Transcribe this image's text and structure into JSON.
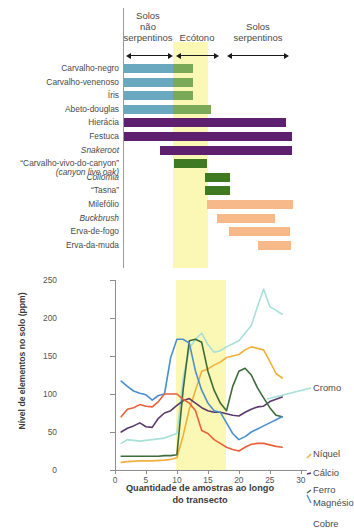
{
  "top_panel": {
    "zones": [
      {
        "key": "nonserpentine",
        "label": "Solos\nnão\nserpentinos",
        "x_start": 127,
        "x_end": 173
      },
      {
        "key": "ecotone",
        "label": "Ecótono",
        "x_start": 176,
        "x_end": 219
      },
      {
        "key": "serpentine",
        "label": "Solos\nserpentinos",
        "x_start": 227,
        "x_end": 289
      }
    ],
    "zone_labels": {
      "nonserpentine": "Solos\nnão\nserpentinos",
      "ecotone": "Ecótono",
      "serpentine": "Solos\nserpentinos"
    },
    "ecotone_band_color": "#fbf7b4",
    "colors": {
      "blue": "#6aa8bf",
      "green": "#7aa957",
      "dark_green": "#3f7a22",
      "purple": "#5d1f6e",
      "orange": "#f7b98a"
    },
    "species": [
      {
        "name": "Carvalho-negro",
        "italic": false,
        "segments": [
          {
            "color": "blue",
            "start": 124,
            "end": 173
          },
          {
            "color": "green",
            "start": 173,
            "end": 193
          }
        ]
      },
      {
        "name": "Carvalho-venenoso",
        "italic": false,
        "segments": [
          {
            "color": "blue",
            "start": 124,
            "end": 173
          },
          {
            "color": "green",
            "start": 173,
            "end": 193
          }
        ]
      },
      {
        "name": "Íris",
        "italic": false,
        "segments": [
          {
            "color": "blue",
            "start": 124,
            "end": 173
          },
          {
            "color": "green",
            "start": 173,
            "end": 193
          }
        ]
      },
      {
        "name": "Abeto-douglas",
        "italic": false,
        "segments": [
          {
            "color": "blue",
            "start": 124,
            "end": 173
          },
          {
            "color": "green",
            "start": 173,
            "end": 211
          }
        ]
      },
      {
        "name": "Hierácia",
        "italic": false,
        "segments": [
          {
            "color": "purple",
            "start": 124,
            "end": 286
          }
        ]
      },
      {
        "name": "Festuca",
        "italic": false,
        "segments": [
          {
            "color": "purple",
            "start": 124,
            "end": 292
          }
        ]
      },
      {
        "name": "Snakeroot",
        "italic": true,
        "segments": [
          {
            "color": "purple",
            "start": 160,
            "end": 292
          }
        ]
      },
      {
        "name": "“Carvalho-vivo-do-canyon”",
        "subname": "(canyon live oak)",
        "italic": false,
        "segments": [
          {
            "color": "dark_green",
            "start": 174,
            "end": 207
          }
        ]
      },
      {
        "name": "Collomia",
        "italic": true,
        "segments": [
          {
            "color": "dark_green",
            "start": 205,
            "end": 230
          }
        ]
      },
      {
        "name": "“Tasna”",
        "italic": false,
        "segments": [
          {
            "color": "dark_green",
            "start": 205,
            "end": 230
          }
        ]
      },
      {
        "name": "Milefólio",
        "italic": false,
        "segments": [
          {
            "color": "orange",
            "start": 207,
            "end": 293
          }
        ]
      },
      {
        "name": "Buckbrush",
        "italic": true,
        "segments": [
          {
            "color": "orange",
            "start": 217,
            "end": 275
          }
        ]
      },
      {
        "name": "Erva-de-fogo",
        "italic": false,
        "segments": [
          {
            "color": "orange",
            "start": 229,
            "end": 290
          }
        ]
      },
      {
        "name": "Erva-da-muda",
        "italic": false,
        "segments": [
          {
            "color": "orange",
            "start": 258,
            "end": 291
          }
        ]
      }
    ]
  },
  "chart_data": {
    "type": "line",
    "title": "",
    "xlabel": "Quantidade de amostras ao longo do transecto",
    "ylabel": "Nível de elementos no solo (ppm)",
    "xlim": [
      0,
      31
    ],
    "ylim": [
      0,
      250
    ],
    "xticks": [
      0,
      5,
      10,
      15,
      20,
      25,
      30
    ],
    "yticks": [
      0,
      50,
      100,
      150,
      200,
      250
    ],
    "grid": false,
    "legend_position": "right-inline",
    "shaded_region": {
      "label": "Ecótono",
      "x_start": 9.5,
      "x_end": 17.3,
      "color": "#fbf7b4"
    },
    "series": [
      {
        "name": "Cromo",
        "color": "#a8dfd8",
        "x": [
          1,
          2,
          4,
          6,
          8,
          9,
          10,
          11,
          12,
          13,
          14,
          15,
          16,
          17,
          18,
          20,
          22,
          23,
          24,
          25,
          26,
          27
        ],
        "values": [
          35,
          40,
          38,
          40,
          42,
          45,
          48,
          120,
          160,
          172,
          180,
          165,
          155,
          157,
          162,
          170,
          190,
          215,
          238,
          215,
          210,
          205
        ]
      },
      {
        "name": "Níquel",
        "color": "#f0b03c",
        "x": [
          1,
          2,
          4,
          6,
          8,
          9,
          10,
          11,
          12,
          13,
          14,
          15,
          16,
          17,
          18,
          19,
          20,
          21,
          22,
          23,
          24,
          25,
          26,
          27
        ],
        "values": [
          10,
          11,
          12,
          12,
          13,
          14,
          16,
          45,
          80,
          105,
          130,
          133,
          138,
          142,
          148,
          150,
          152,
          158,
          162,
          160,
          158,
          143,
          127,
          121
        ]
      },
      {
        "name": "Cálcio",
        "color": "#5b3a6e",
        "x": [
          1,
          2,
          3,
          4,
          5,
          6,
          7,
          8,
          9,
          10,
          11,
          12,
          13,
          14,
          15,
          16,
          17,
          18,
          19,
          20,
          21,
          22,
          23,
          24,
          25,
          26,
          27
        ],
        "values": [
          50,
          55,
          58,
          62,
          57,
          56,
          68,
          75,
          78,
          85,
          91,
          94,
          88,
          82,
          78,
          76,
          76,
          74,
          72,
          71,
          76,
          80,
          83,
          84,
          90,
          93,
          96
        ]
      },
      {
        "name": "Ferro",
        "color": "#3d6b3a",
        "x": [
          1,
          3,
          5,
          7,
          8,
          9,
          10,
          11,
          12,
          13,
          14,
          15,
          16,
          17,
          18,
          19,
          20,
          21,
          22,
          23,
          24,
          25,
          26,
          27
        ],
        "values": [
          18,
          18,
          18,
          18,
          19,
          19,
          20,
          105,
          170,
          172,
          168,
          130,
          105,
          88,
          78,
          110,
          130,
          134,
          125,
          108,
          95,
          82,
          72,
          70
        ]
      },
      {
        "name": "Magnésio",
        "color": "#4d8fcc",
        "x": [
          1,
          2,
          3,
          4,
          5,
          6,
          7,
          8,
          9,
          10,
          11,
          12,
          13,
          14,
          15,
          16,
          17,
          18,
          19,
          20,
          21,
          22,
          23,
          24,
          25,
          26,
          27
        ],
        "values": [
          117,
          110,
          104,
          101,
          99,
          92,
          98,
          100,
          148,
          172,
          172,
          167,
          130,
          105,
          88,
          78,
          76,
          62,
          48,
          40,
          44,
          50,
          54,
          58,
          62,
          66,
          70
        ]
      },
      {
        "name": "Cobre",
        "color": "#e8603c",
        "x": [
          1,
          2,
          3,
          4,
          5,
          6,
          7,
          8,
          9,
          10,
          11,
          12,
          13,
          14,
          15,
          16,
          17,
          18,
          19,
          20,
          21,
          22,
          23,
          24,
          25,
          26,
          27
        ],
        "values": [
          70,
          80,
          82,
          86,
          84,
          83,
          90,
          100,
          100,
          100,
          93,
          88,
          78,
          52,
          48,
          40,
          35,
          30,
          27,
          25,
          30,
          34,
          35,
          35,
          33,
          31,
          30
        ]
      }
    ]
  }
}
